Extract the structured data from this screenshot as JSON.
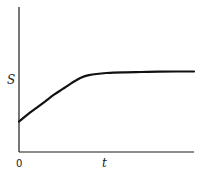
{
  "chart_data": {
    "type": "line",
    "title": "",
    "xlabel": "t",
    "ylabel": "S",
    "x_tick_labels": [
      "0"
    ],
    "xlim": [
      0,
      10
    ],
    "ylim": [
      0,
      10
    ],
    "grid": false,
    "legend": "none",
    "series": [
      {
        "name": "S(t)",
        "x": [
          0,
          0.5,
          1,
          1.5,
          2,
          2.5,
          3,
          3.5,
          4,
          5,
          6,
          7,
          8,
          9,
          10
        ],
        "y": [
          2.1,
          2.6,
          3.05,
          3.5,
          3.95,
          4.35,
          4.75,
          5.1,
          5.3,
          5.45,
          5.5,
          5.52,
          5.54,
          5.55,
          5.55
        ]
      }
    ]
  }
}
